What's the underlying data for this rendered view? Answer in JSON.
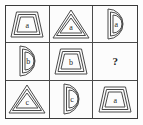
{
  "puzzle": {
    "kind": "matrix-reasoning-3x3",
    "rows": 3,
    "columns": 3,
    "stroke_color": "#4a4a4a",
    "frame_color": "#3a3a3a",
    "background_color": "#fcfcfc",
    "label_color": "#262626",
    "cells": [
      {
        "position": "r1c1",
        "shape": "trapezoid",
        "shape_icon": "trapezoid-icon",
        "label": "a",
        "nesting": 3
      },
      {
        "position": "r1c2",
        "shape": "triangle",
        "shape_icon": "triangle-icon",
        "label": "a",
        "nesting": 3
      },
      {
        "position": "r1c3",
        "shape": "semicircle",
        "shape_icon": "semicircle-icon",
        "label": "a",
        "nesting": 3
      },
      {
        "position": "r2c1",
        "shape": "semicircle",
        "shape_icon": "semicircle-icon",
        "label": "b",
        "nesting": 3
      },
      {
        "position": "r2c2",
        "shape": "trapezoid",
        "shape_icon": "trapezoid-icon",
        "label": "b",
        "nesting": 3
      },
      {
        "position": "r2c3",
        "shape": "unknown",
        "shape_icon": "question-mark-icon",
        "label": "?",
        "nesting": 0
      },
      {
        "position": "r3c1",
        "shape": "triangle",
        "shape_icon": "triangle-icon",
        "label": "c",
        "nesting": 3
      },
      {
        "position": "r3c2",
        "shape": "semicircle",
        "shape_icon": "semicircle-icon",
        "label": "c",
        "nesting": 3
      },
      {
        "position": "r3c3",
        "shape": "trapezoid",
        "shape_icon": "trapezoid-icon",
        "label": "a",
        "nesting": 3
      }
    ]
  }
}
